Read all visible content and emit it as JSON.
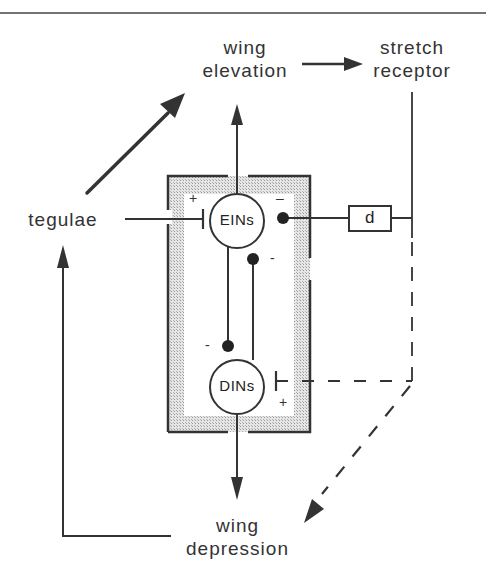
{
  "diagram": {
    "type": "neural-circuit",
    "nodes": {
      "wing_elevation": {
        "line1": "wing",
        "line2": "elevation"
      },
      "stretch_receptor": {
        "line1": "stretch",
        "line2": "receptor"
      },
      "tegulae": {
        "label": "tegulae"
      },
      "wing_depression": {
        "line1": "wing",
        "line2": "depression"
      },
      "eins": {
        "label": "EINs"
      },
      "dins": {
        "label": "DINs"
      },
      "delay": {
        "label": "d"
      }
    },
    "signs": {
      "tegulae_to_eins": "+",
      "stretch_to_eins": "–",
      "dins_to_eins": "-",
      "eins_to_dins": "-",
      "stretch_to_dins": "+"
    },
    "edges": [
      {
        "from": "tegulae",
        "to": "wing_elevation",
        "style": "solid-arrow"
      },
      {
        "from": "wing_elevation",
        "to": "stretch_receptor",
        "style": "solid-arrow"
      },
      {
        "from": "eins",
        "to": "wing_elevation",
        "style": "solid-arrow"
      },
      {
        "from": "tegulae",
        "to": "eins",
        "style": "excitatory-bar",
        "sign": "+"
      },
      {
        "from": "stretch_receptor",
        "to": "eins",
        "via": "delay",
        "style": "inhibitory-dot",
        "sign": "-"
      },
      {
        "from": "dins",
        "to": "eins",
        "style": "inhibitory-dot",
        "sign": "-"
      },
      {
        "from": "eins",
        "to": "dins",
        "style": "inhibitory-dot",
        "sign": "-"
      },
      {
        "from": "stretch_receptor",
        "to": "dins",
        "style": "dashed-excitatory-bar",
        "sign": "+"
      },
      {
        "from": "stretch_receptor",
        "to": "wing_depression",
        "style": "dashed-arrow"
      },
      {
        "from": "dins",
        "to": "wing_depression",
        "style": "solid-arrow"
      },
      {
        "from": "wing_depression",
        "to": "tegulae",
        "style": "solid-arrow"
      }
    ]
  }
}
